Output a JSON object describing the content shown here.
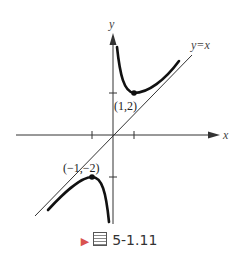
{
  "figure": {
    "axes": {
      "x_label": "x",
      "y_label": "y"
    },
    "asymptote_label": "y=x",
    "points": [
      {
        "label": "(1,2)",
        "x": 1,
        "y": 2
      },
      {
        "label": "(−1,−2)",
        "x": -1,
        "y": -2
      }
    ],
    "caption": {
      "text": "5-1.11",
      "prefix_glyph": "圖"
    }
  }
}
